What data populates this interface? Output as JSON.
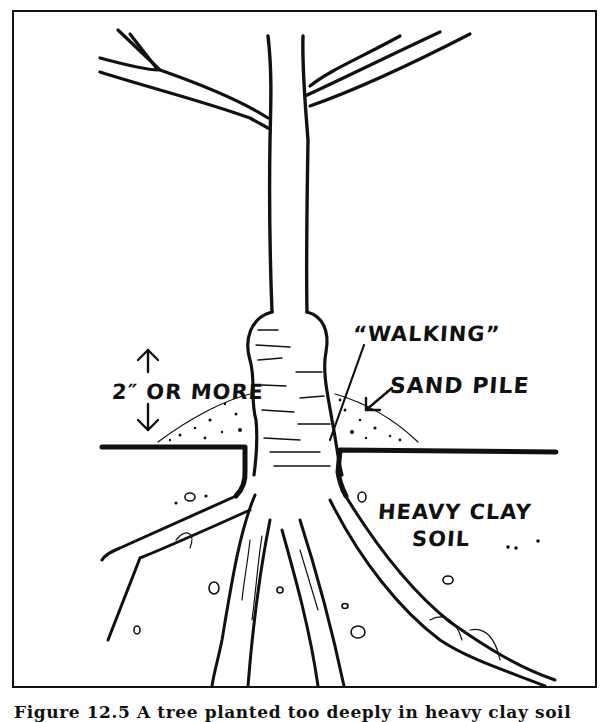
{
  "figure": {
    "title": "Tree planted too deeply in heavy clay soil",
    "labels": {
      "walking": "“WALKING”",
      "sand_pile": "SAND PILE",
      "depth": "2″ OR MORE",
      "soil_line1": "HEAVY CLAY",
      "soil_line2": "SOIL"
    },
    "caption": "Figure 12.5  A tree planted too deeply in heavy clay soil"
  },
  "colors": {
    "ink": "#111111",
    "paper": "#ffffff"
  }
}
